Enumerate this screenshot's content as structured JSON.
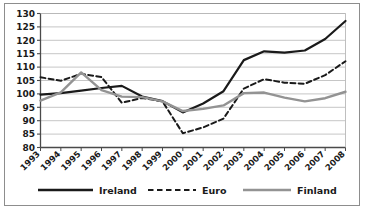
{
  "chart_data": {
    "type": "line",
    "title": "",
    "subtitle": "",
    "xlabel": "",
    "ylabel": "",
    "categories": [
      "1993",
      "1994",
      "1995",
      "1996",
      "1997",
      "1998",
      "1999",
      "2000",
      "2001",
      "2002",
      "2003",
      "2004",
      "2005",
      "2006",
      "2007",
      "2008"
    ],
    "x": [
      1993,
      1994,
      1995,
      1996,
      1997,
      1998,
      1999,
      2000,
      2001,
      2002,
      2003,
      2004,
      2005,
      2006,
      2007,
      2008
    ],
    "ylim": [
      80,
      130
    ],
    "yticks": [
      80,
      85,
      90,
      95,
      100,
      105,
      110,
      115,
      120,
      125,
      130
    ],
    "ytick_labels": [
      "80",
      "85",
      "90",
      "95",
      "100",
      "105",
      "110",
      "115",
      "120",
      "125",
      "130"
    ],
    "grid": true,
    "grid_axis": "y",
    "legend_position": "bottom",
    "series": [
      {
        "name": "Ireland",
        "style": "solid",
        "color": "#1a1a1a",
        "width": 2.2,
        "values": [
          99.7,
          100.3,
          101.2,
          102.2,
          103.0,
          99.0,
          97.3,
          93.1,
          96.4,
          101.0,
          112.6,
          115.9,
          115.4,
          116.2,
          120.5,
          127.2
        ]
      },
      {
        "name": "Euro",
        "style": "dashed",
        "color": "#1a1a1a",
        "width": 2.0,
        "values": [
          106.2,
          104.9,
          107.5,
          106.3,
          96.7,
          98.5,
          97.2,
          85.3,
          87.5,
          90.8,
          102.0,
          105.5,
          104.2,
          103.8,
          107.0,
          112.2
        ]
      },
      {
        "name": "Finland",
        "style": "solid",
        "color": "#939393",
        "width": 2.4,
        "values": [
          97.5,
          100.6,
          108.0,
          101.4,
          99.0,
          98.8,
          97.2,
          93.6,
          94.4,
          95.7,
          100.3,
          100.5,
          98.6,
          97.2,
          98.4,
          100.8
        ]
      }
    ]
  },
  "legend": {
    "items": [
      {
        "label": "Ireland",
        "style": "solid",
        "color": "#1a1a1a"
      },
      {
        "label": "Euro",
        "style": "dashed",
        "color": "#1a1a1a"
      },
      {
        "label": "Finland",
        "style": "solid",
        "color": "#939393"
      }
    ]
  },
  "axes": {
    "y_tick_labels": [
      "130",
      "125",
      "120",
      "115",
      "110",
      "105",
      "100",
      "95",
      "90",
      "85",
      "80"
    ],
    "x_tick_labels": [
      "1993",
      "1994",
      "1995",
      "1996",
      "1997",
      "1998",
      "1999",
      "2000",
      "2001",
      "2002",
      "2003",
      "2004",
      "2005",
      "2006",
      "2007",
      "2008"
    ]
  },
  "colors": {
    "ireland": "#1a1a1a",
    "euro": "#1a1a1a",
    "finland": "#939393",
    "grid": "#b8b8b8",
    "axis": "#4a4a4a",
    "frame": "#8d8d8d",
    "background": "#ffffff"
  }
}
